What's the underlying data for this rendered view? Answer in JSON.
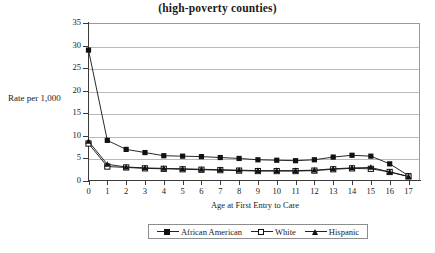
{
  "chart_data": {
    "type": "line",
    "title": "(high-poverty counties)",
    "xlabel": "Age at First Entry to Care",
    "ylabel": "Rate per 1,000",
    "x": [
      0,
      1,
      2,
      3,
      4,
      5,
      6,
      7,
      8,
      9,
      10,
      11,
      12,
      13,
      14,
      15,
      16,
      17
    ],
    "xtick_labels": [
      "0",
      "1",
      "2",
      "3",
      "4",
      "5",
      "6",
      "7",
      "8",
      "9",
      "10",
      "11",
      "12",
      "13",
      "14",
      "15",
      "16",
      "17"
    ],
    "ytick_labels": [
      "0",
      "5",
      "10",
      "15",
      "20",
      "25",
      "30",
      "35"
    ],
    "yticks": [
      0,
      5,
      10,
      15,
      20,
      25,
      30,
      35
    ],
    "ylim": [
      0,
      35
    ],
    "xlim": [
      0,
      17
    ],
    "grid": "horizontal",
    "legend_position": "bottom",
    "series": [
      {
        "name": "African American",
        "marker": "filled-square",
        "values": [
          29.0,
          9.0,
          7.0,
          6.3,
          5.6,
          5.5,
          5.4,
          5.2,
          5.0,
          4.7,
          4.6,
          4.5,
          4.7,
          5.3,
          5.7,
          5.5,
          3.8,
          1.2
        ]
      },
      {
        "name": "White",
        "marker": "open-square",
        "values": [
          8.3,
          3.2,
          3.0,
          2.8,
          2.7,
          2.6,
          2.5,
          2.4,
          2.3,
          2.2,
          2.2,
          2.2,
          2.3,
          2.6,
          2.8,
          2.7,
          2.0,
          1.0
        ]
      },
      {
        "name": "Hispanic",
        "marker": "filled-triangle",
        "values": [
          8.8,
          3.7,
          3.1,
          2.9,
          2.8,
          2.7,
          2.6,
          2.5,
          2.4,
          2.3,
          2.3,
          2.3,
          2.4,
          2.7,
          2.9,
          3.0,
          2.0,
          1.0
        ]
      }
    ],
    "colors": {
      "series": "#111111",
      "grid": "#b9b9b9",
      "axis": "#3a3a3a",
      "background": "#ffffff"
    }
  }
}
